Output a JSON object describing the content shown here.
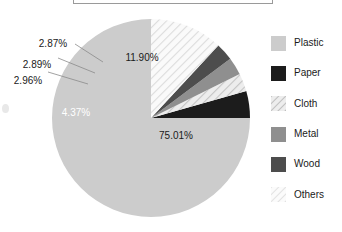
{
  "chart_data": {
    "type": "pie",
    "title": "",
    "categories": [
      "Plastic",
      "Paper",
      "Cloth",
      "Metal",
      "Wood",
      "Others"
    ],
    "values": [
      75.01,
      4.37,
      2.96,
      2.89,
      2.87,
      11.9
    ],
    "value_labels": [
      "75.01%",
      "4.37%",
      "2.96%",
      "2.89%",
      "2.87%",
      "11.90%"
    ],
    "unit": "%",
    "legend_position": "right",
    "grid": false,
    "start_angle_deg": 0,
    "direction": "counterclockwise",
    "colors": [
      "#cccccc",
      "#1c1c1c",
      "#e0e0e0",
      "#8f8f8f",
      "#4d4d4d",
      "#f0f0f0"
    ],
    "patterns": [
      "solid",
      "solid",
      "diagonal-hatch",
      "solid",
      "solid",
      "diagonal-hatch"
    ],
    "slices": [
      {
        "name": "Plastic",
        "value": 75.01,
        "label": "75.01%",
        "color": "#cccccc",
        "pattern": "solid",
        "label_color": "dark"
      },
      {
        "name": "Paper",
        "value": 4.37,
        "label": "4.37%",
        "color": "#1c1c1c",
        "pattern": "solid",
        "label_color": "light"
      },
      {
        "name": "Cloth",
        "value": 2.96,
        "label": "2.96%",
        "color": "#e0e0e0",
        "pattern": "diagonal-hatch",
        "label_color": "dark"
      },
      {
        "name": "Metal",
        "value": 2.89,
        "label": "2.89%",
        "color": "#8f8f8f",
        "pattern": "solid",
        "label_color": "dark"
      },
      {
        "name": "Wood",
        "value": 2.87,
        "label": "2.87%",
        "color": "#4d4d4d",
        "pattern": "solid",
        "label_color": "dark"
      },
      {
        "name": "Others",
        "value": 11.9,
        "label": "11.90%",
        "color": "#f0f0f0",
        "pattern": "diagonal-hatch",
        "label_color": "dark"
      }
    ]
  },
  "legend": {
    "items": [
      {
        "label": "Plastic",
        "color": "#cccccc",
        "pattern": "solid"
      },
      {
        "label": "Paper",
        "color": "#1c1c1c",
        "pattern": "solid"
      },
      {
        "label": "Cloth",
        "color": "#e0e0e0",
        "pattern": "diagonal-hatch"
      },
      {
        "label": "Metal",
        "color": "#8f8f8f",
        "pattern": "solid"
      },
      {
        "label": "Wood",
        "color": "#4d4d4d",
        "pattern": "solid"
      },
      {
        "label": "Others",
        "color": "#f0f0f0",
        "pattern": "diagonal-hatch"
      }
    ]
  },
  "labels": {
    "plastic": "75.01%",
    "paper": "4.37%",
    "cloth": "2.96%",
    "metal": "2.89%",
    "wood": "2.87%",
    "others": "11.90%"
  }
}
